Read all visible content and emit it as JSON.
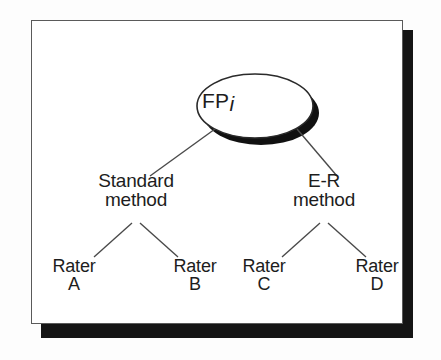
{
  "figure": {
    "type": "tree-diagram",
    "root": {
      "label": "FP",
      "subscript": "i",
      "shape": "ellipse",
      "shape_name": "ellipse-node",
      "has_drop_shadow": true
    },
    "levels": [
      {
        "name": "method-level",
        "nodes": [
          {
            "id": "standard-method",
            "line1": "Standard",
            "line2": "method"
          },
          {
            "id": "er-method",
            "line1": "E-R",
            "line2": "method"
          }
        ]
      },
      {
        "name": "rater-level",
        "nodes": [
          {
            "id": "rater-a",
            "line1": "Rater",
            "line2": "A"
          },
          {
            "id": "rater-b",
            "line1": "Rater",
            "line2": "B"
          },
          {
            "id": "rater-c",
            "line1": "Rater",
            "line2": "C"
          },
          {
            "id": "rater-d",
            "line1": "Rater",
            "line2": "D"
          }
        ]
      }
    ],
    "edges": [
      {
        "from": "root",
        "to": "standard-method"
      },
      {
        "from": "root",
        "to": "er-method"
      },
      {
        "from": "standard-method",
        "to": "rater-a"
      },
      {
        "from": "standard-method",
        "to": "rater-b"
      },
      {
        "from": "er-method",
        "to": "rater-c"
      },
      {
        "from": "er-method",
        "to": "rater-d"
      }
    ],
    "colors": {
      "page_background": "#fdfdfd",
      "frame_background": "#ffffff",
      "frame_border": "#5a5a5a",
      "frame_shadow": "#151515",
      "text": "#1d1d1d",
      "line": "#4a4a4a",
      "ellipse_stroke": "#2a2a2a",
      "ellipse_shadow": "#111111"
    }
  }
}
